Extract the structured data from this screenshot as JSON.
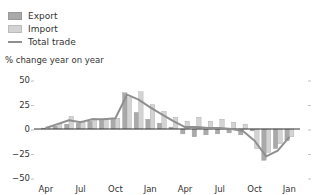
{
  "legend": {
    "export_label": "Export",
    "import_label": "Import",
    "total_label": "Total trade"
  },
  "axis": {
    "y_title": "% change year on year"
  },
  "colors": {
    "export": "#a9a9a9",
    "import": "#d3d3d3",
    "total": "#8f8f8f",
    "zero_line": "#333333"
  },
  "chart_data": {
    "type": "bar",
    "title": "",
    "xlabel": "",
    "ylabel": "% change year on year",
    "ylim": [
      -50,
      50
    ],
    "yticks": [
      50,
      25,
      0,
      -25,
      -50
    ],
    "xtick_labels": [
      "Apr",
      "Jul",
      "Oct",
      "Jan",
      "Apr",
      "Jul",
      "Oct",
      "Jan"
    ],
    "categories": [
      "Apr",
      "May",
      "Jun",
      "Jul",
      "Aug",
      "Sep",
      "Oct",
      "Nov",
      "Dec",
      "Jan",
      "Feb",
      "Mar",
      "Apr",
      "May",
      "Jun",
      "Jul",
      "Aug",
      "Sep",
      "Oct",
      "Nov",
      "Dec",
      "Jan"
    ],
    "series": [
      {
        "name": "Export",
        "type": "bar",
        "values": [
          1,
          3,
          5,
          6,
          8,
          9,
          10,
          37,
          17,
          10,
          6,
          2,
          -5,
          -8,
          -6,
          -5,
          -4,
          -6,
          -2,
          -32,
          -20,
          -12
        ]
      },
      {
        "name": "Import",
        "type": "bar",
        "values": [
          2,
          6,
          13,
          7,
          11,
          11,
          11,
          32,
          38,
          25,
          18,
          12,
          8,
          12,
          8,
          10,
          7,
          5,
          -20,
          -24,
          -15,
          -8
        ]
      },
      {
        "name": "Total trade",
        "type": "line",
        "values": [
          1,
          5,
          9,
          7,
          10,
          10,
          11,
          35,
          30,
          22,
          15,
          8,
          2,
          2,
          1,
          1,
          0,
          -2,
          -12,
          -28,
          -22,
          -8
        ]
      }
    ],
    "grid": false,
    "legend_position": "top-left"
  }
}
